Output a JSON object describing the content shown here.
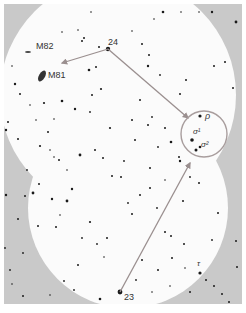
{
  "map": {
    "type": "star-chart",
    "colors": {
      "frame_bg": "#c9c9c9",
      "field_bg": "#fbfbfb",
      "star": "#1a1a1a",
      "arrow": "#9a8f8f",
      "circle": "#a89d9d",
      "label": "#333333"
    },
    "fields_of_view": [
      {
        "name": "upper-field",
        "cx": 118,
        "cy": 95,
        "r": 118
      },
      {
        "name": "lower-field",
        "cx": 128,
        "cy": 208,
        "r": 100
      }
    ],
    "labels": {
      "m82": "M82",
      "m81": "M81",
      "star_24": "24",
      "star_23": "23",
      "rho": "ρ",
      "sigma1": "σ¹",
      "sigma2": "σ²",
      "tau": "τ"
    },
    "label_positions": {
      "m82": {
        "x": 48,
        "y": 46
      },
      "m81": {
        "x": 48,
        "y": 75
      },
      "star_24": {
        "x": 110,
        "y": 42
      },
      "star_23": {
        "x": 123,
        "y": 295
      },
      "rho": {
        "x": 207,
        "y": 117
      },
      "sigma1": {
        "x": 193,
        "y": 133
      },
      "sigma2": {
        "x": 202,
        "y": 146
      },
      "tau": {
        "x": 196,
        "y": 263
      }
    },
    "arrows": [
      {
        "name": "arrow-24-to-m81",
        "from": [
          108,
          49
        ],
        "to": [
          62,
          63
        ]
      },
      {
        "name": "arrow-24-to-circle",
        "from": [
          108,
          49
        ],
        "to": [
          188,
          118
        ]
      },
      {
        "name": "arrow-23-to-circle",
        "from": [
          120,
          292
        ],
        "to": [
          190,
          163
        ]
      }
    ],
    "target_circle": {
      "cx": 204,
      "cy": 134,
      "r": 23
    },
    "objects": {
      "m81": {
        "cx": 42,
        "cy": 76,
        "rx": 3,
        "ry": 6,
        "rot": 30
      },
      "m82": {
        "cx": 28,
        "cy": 52,
        "rx": 3,
        "ry": 1,
        "rot": 0
      }
    },
    "stars": [
      [
        108,
        49,
        2.2
      ],
      [
        120,
        292,
        2.4
      ],
      [
        200,
        116,
        1.6
      ],
      [
        192,
        140,
        1.8
      ],
      [
        196,
        150,
        1.5
      ],
      [
        200,
        147,
        1.3
      ],
      [
        200,
        273,
        1.6
      ],
      [
        89,
        70,
        1.3
      ],
      [
        96,
        67,
        1
      ],
      [
        84,
        38,
        1
      ],
      [
        82,
        41,
        1
      ],
      [
        99,
        47,
        1
      ],
      [
        62,
        32,
        0.8
      ],
      [
        78,
        30,
        0.8
      ],
      [
        91,
        12,
        0.8
      ],
      [
        163,
        12,
        1.3
      ],
      [
        181,
        12,
        0.8
      ],
      [
        199,
        12,
        0.8
      ],
      [
        212,
        12,
        1.2
      ],
      [
        236,
        22,
        1.4
      ],
      [
        214,
        66,
        1
      ],
      [
        225,
        62,
        1
      ],
      [
        233,
        88,
        1
      ],
      [
        12,
        66,
        0.8
      ],
      [
        15,
        84,
        1.2
      ],
      [
        20,
        94,
        1
      ],
      [
        8,
        122,
        1
      ],
      [
        6,
        130,
        1.2
      ],
      [
        18,
        139,
        1
      ],
      [
        27,
        170,
        0.9
      ],
      [
        6,
        195,
        1.2
      ],
      [
        18,
        219,
        1
      ],
      [
        5,
        248,
        0.9
      ],
      [
        23,
        253,
        0.9
      ],
      [
        10,
        270,
        0.9
      ],
      [
        12,
        284,
        0.8
      ],
      [
        23,
        296,
        1
      ],
      [
        74,
        290,
        0.9
      ],
      [
        100,
        299,
        1.3
      ],
      [
        116,
        305,
        0.8
      ],
      [
        190,
        292,
        1
      ],
      [
        206,
        280,
        1
      ],
      [
        214,
        286,
        1
      ],
      [
        222,
        294,
        1
      ],
      [
        229,
        302,
        1
      ],
      [
        236,
        241,
        1
      ],
      [
        237,
        267,
        1
      ],
      [
        154,
        19,
        0.8
      ],
      [
        132,
        31,
        0.8
      ],
      [
        142,
        44,
        1
      ],
      [
        149,
        55,
        1
      ],
      [
        148,
        66,
        1.2
      ],
      [
        160,
        75,
        0.9
      ],
      [
        180,
        94,
        1
      ],
      [
        186,
        80,
        1
      ],
      [
        101,
        89,
        1.1
      ],
      [
        92,
        95,
        1
      ],
      [
        75,
        109,
        1.2
      ],
      [
        54,
        119,
        0.8
      ],
      [
        40,
        146,
        1.1
      ],
      [
        48,
        132,
        1
      ],
      [
        59,
        160,
        1
      ],
      [
        54,
        157,
        0.8
      ],
      [
        67,
        201,
        1.4
      ],
      [
        72,
        189,
        1.2
      ],
      [
        52,
        199,
        1.2
      ],
      [
        38,
        226,
        1
      ],
      [
        56,
        227,
        1
      ],
      [
        90,
        222,
        1.1
      ],
      [
        97,
        244,
        0.9
      ],
      [
        104,
        257,
        0.8
      ],
      [
        107,
        238,
        1
      ],
      [
        132,
        214,
        1
      ],
      [
        150,
        188,
        1
      ],
      [
        157,
        208,
        0.9
      ],
      [
        165,
        232,
        1
      ],
      [
        183,
        201,
        1
      ],
      [
        190,
        177,
        0.9
      ],
      [
        199,
        183,
        1
      ],
      [
        180,
        161,
        1.2
      ],
      [
        171,
        236,
        1
      ],
      [
        142,
        260,
        1
      ],
      [
        158,
        270,
        1
      ],
      [
        172,
        258,
        1
      ],
      [
        184,
        244,
        1
      ],
      [
        218,
        213,
        1
      ],
      [
        212,
        240,
        0.9
      ],
      [
        80,
        155,
        1.4
      ],
      [
        95,
        150,
        1
      ],
      [
        103,
        158,
        1
      ],
      [
        112,
        176,
        1
      ],
      [
        121,
        177,
        1
      ],
      [
        128,
        203,
        0.9
      ],
      [
        140,
        195,
        1
      ],
      [
        124,
        161,
        0.9
      ],
      [
        25,
        196,
        1
      ],
      [
        33,
        193,
        1.4
      ],
      [
        39,
        184,
        1
      ],
      [
        60,
        215,
        0.8
      ],
      [
        82,
        238,
        0.9
      ],
      [
        132,
        120,
        1
      ],
      [
        148,
        125,
        1
      ],
      [
        152,
        117,
        0.9
      ],
      [
        140,
        100,
        1
      ],
      [
        165,
        128,
        1
      ],
      [
        171,
        142,
        1.3
      ],
      [
        179,
        157,
        1
      ],
      [
        158,
        147,
        0.9
      ],
      [
        135,
        140,
        1
      ],
      [
        110,
        128,
        1.1
      ],
      [
        90,
        112,
        0.9
      ],
      [
        62,
        101,
        1.3
      ],
      [
        50,
        150,
        0.8
      ],
      [
        67,
        170,
        0.8
      ],
      [
        30,
        105,
        0.8
      ],
      [
        36,
        120,
        0.8
      ],
      [
        44,
        103,
        1.1
      ],
      [
        150,
        168,
        1
      ],
      [
        165,
        180,
        0.8
      ],
      [
        78,
        265,
        1
      ],
      [
        64,
        281,
        0.9
      ],
      [
        50,
        295,
        0.8
      ],
      [
        136,
        280,
        0.9
      ],
      [
        152,
        292,
        0.8
      ],
      [
        170,
        286,
        0.8
      ],
      [
        185,
        268,
        0.8
      ]
    ]
  }
}
